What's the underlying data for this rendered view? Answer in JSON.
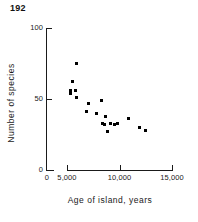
{
  "page": {
    "number": "192"
  },
  "chart_data": {
    "type": "scatter",
    "title": "",
    "subtitle": "",
    "xlabel": "Age of island, years",
    "ylabel": "Number of species",
    "xlim": [
      0,
      15000
    ],
    "ylim": [
      0,
      100
    ],
    "grid": false,
    "legend": null,
    "axis_break": true,
    "xticks": [
      {
        "value": 0,
        "label": "0"
      },
      {
        "value": 5000,
        "label": "5,000"
      },
      {
        "value": 10000,
        "label": "10,000"
      },
      {
        "value": 15000,
        "label": "15,000"
      }
    ],
    "yticks": [
      {
        "value": 0,
        "label": "0"
      },
      {
        "value": 50,
        "label": "50"
      },
      {
        "value": 100,
        "label": "100"
      }
    ],
    "points": [
      {
        "x": 5900,
        "y": 75
      },
      {
        "x": 5500,
        "y": 62
      },
      {
        "x": 5300,
        "y": 56
      },
      {
        "x": 5300,
        "y": 54
      },
      {
        "x": 5800,
        "y": 56
      },
      {
        "x": 5900,
        "y": 51
      },
      {
        "x": 7000,
        "y": 47
      },
      {
        "x": 8300,
        "y": 49
      },
      {
        "x": 6900,
        "y": 41
      },
      {
        "x": 7800,
        "y": 40
      },
      {
        "x": 8700,
        "y": 38
      },
      {
        "x": 8400,
        "y": 33
      },
      {
        "x": 8600,
        "y": 32
      },
      {
        "x": 9500,
        "y": 32
      },
      {
        "x": 9800,
        "y": 33
      },
      {
        "x": 10900,
        "y": 36
      },
      {
        "x": 8900,
        "y": 27
      },
      {
        "x": 9100,
        "y": 33
      },
      {
        "x": 11900,
        "y": 30
      },
      {
        "x": 12500,
        "y": 28
      }
    ]
  }
}
